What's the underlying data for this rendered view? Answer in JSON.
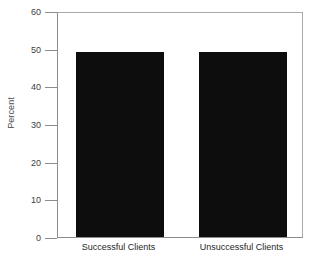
{
  "chart_data": {
    "type": "bar",
    "title": "",
    "subtitle": "",
    "xlabel": "",
    "ylabel": "Percent",
    "categories": [
      "Successful Clients",
      "Unsuccessful Clients"
    ],
    "values": [
      49,
      49
    ],
    "ylim": [
      0,
      60
    ],
    "yticks": [
      0,
      10,
      20,
      30,
      40,
      50,
      60
    ],
    "ytick_labels": [
      "0",
      "10",
      "20",
      "30",
      "40",
      "50",
      "60"
    ],
    "grid": false,
    "legend": false,
    "legend_position": "none",
    "bar_color": "#0d0d0d",
    "axis_color": "#8c8c8c",
    "background_color": "#ffffff",
    "annotations": []
  },
  "axis": {
    "y_title": "Percent",
    "ticks": [
      {
        "value": 60,
        "label": "60"
      },
      {
        "value": 50,
        "label": "50"
      },
      {
        "value": 40,
        "label": "40"
      },
      {
        "value": 30,
        "label": "30"
      },
      {
        "value": 20,
        "label": "20"
      },
      {
        "value": 10,
        "label": "10"
      },
      {
        "value": 0,
        "label": "0"
      }
    ]
  },
  "bars": [
    {
      "label": "Successful Clients",
      "value": 49
    },
    {
      "label": "Unsuccessful Clients",
      "value": 49
    }
  ]
}
